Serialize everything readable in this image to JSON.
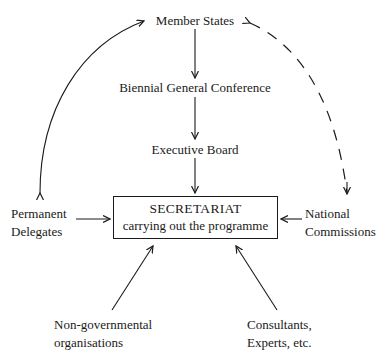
{
  "diagram": {
    "nodes": {
      "member_states": "Member States",
      "conference": "Biennial General Conference",
      "executive_board": "Executive Board",
      "secretariat_title": "SECRETARIAT",
      "secretariat_subtitle": "carrying out the programme",
      "permanent_delegates_line1": "Permanent",
      "permanent_delegates_line2": "Delegates",
      "national_commissions_line1": "National",
      "national_commissions_line2": "Commissions",
      "ngo_line1": "Non-governmental",
      "ngo_line2": "organisations",
      "consultants_line1": "Consultants,",
      "consultants_line2": "Experts, etc."
    },
    "edges": [
      {
        "from": "Member States",
        "to": "Biennial General Conference",
        "style": "solid"
      },
      {
        "from": "Biennial General Conference",
        "to": "Executive Board",
        "style": "solid"
      },
      {
        "from": "Executive Board",
        "to": "SECRETARIAT",
        "style": "solid"
      },
      {
        "from": "Permanent Delegates",
        "to": "SECRETARIAT",
        "style": "solid"
      },
      {
        "from": "National Commissions",
        "to": "SECRETARIAT",
        "style": "solid"
      },
      {
        "from": "Non-governmental organisations",
        "to": "SECRETARIAT",
        "style": "solid"
      },
      {
        "from": "Consultants, Experts, etc.",
        "to": "SECRETARIAT",
        "style": "solid"
      },
      {
        "from": "Member States",
        "to": "Permanent Delegates",
        "style": "solid-curved",
        "bidirectional": true
      },
      {
        "from": "Member States",
        "to": "National Commissions",
        "style": "dashed-curved",
        "bidirectional": true
      }
    ]
  }
}
